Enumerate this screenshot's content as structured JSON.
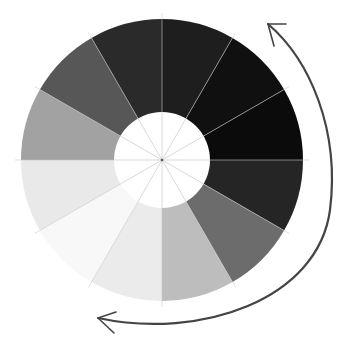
{
  "diagram": {
    "type": "value-scale-wheel",
    "center": [
      162,
      160
    ],
    "outer_radius": 141,
    "inner_radius": 48,
    "segment_count": 12,
    "start_angle_deg": 0,
    "segments": [
      {
        "index": 0,
        "name": "segment-1",
        "color": "#1e1e1e"
      },
      {
        "index": 1,
        "name": "segment-2",
        "color": "#101010"
      },
      {
        "index": 2,
        "name": "segment-3",
        "color": "#0b0b0b"
      },
      {
        "index": 3,
        "name": "segment-4",
        "color": "#252525"
      },
      {
        "index": 4,
        "name": "segment-5",
        "color": "#6c6c6c"
      },
      {
        "index": 5,
        "name": "segment-6",
        "color": "#bdbdbd"
      },
      {
        "index": 6,
        "name": "segment-7",
        "color": "#ebebeb"
      },
      {
        "index": 7,
        "name": "segment-8",
        "color": "#f8f8f8"
      },
      {
        "index": 8,
        "name": "segment-9",
        "color": "#e9e9e9"
      },
      {
        "index": 9,
        "name": "segment-10",
        "color": "#a2a2a2"
      },
      {
        "index": 10,
        "name": "segment-11",
        "color": "#575757"
      },
      {
        "index": 11,
        "name": "segment-12",
        "color": "#2a2a2a"
      }
    ],
    "guide_line_color": "#c8c8c8",
    "arrow": {
      "color": "#444444",
      "direction": "counter-clockwise-from-bottom-to-top",
      "start": [
        98,
        318
      ],
      "end": [
        268,
        24
      ]
    }
  }
}
